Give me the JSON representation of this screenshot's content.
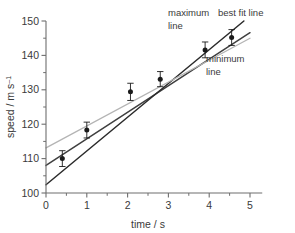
{
  "chart_data": {
    "type": "scatter",
    "title": "",
    "xlabel": "time / s",
    "ylabel": "speed / m s⁻¹",
    "ylabel_main": "speed / m s",
    "ylabel_exponent": "–1",
    "xlim": [
      0,
      5.3
    ],
    "ylim": [
      100,
      150
    ],
    "x_ticks_major": [
      0,
      1,
      2,
      3,
      4,
      5
    ],
    "x_tick_labels": [
      "0",
      "1",
      "2",
      "3",
      "4",
      "5"
    ],
    "x_ticks_minor": [
      0.5,
      1.5,
      2.5,
      3.5,
      4.5
    ],
    "y_ticks_major": [
      100,
      110,
      120,
      130,
      140,
      150
    ],
    "y_tick_labels": [
      "100",
      "110",
      "120",
      "130",
      "140",
      "150"
    ],
    "y_ticks_minor": [
      105,
      115,
      125,
      135,
      145
    ],
    "grid": false,
    "legend_position": "inline-annotations",
    "points": [
      {
        "x": 0.4,
        "y": 110.0,
        "yerr": 2.3
      },
      {
        "x": 1.0,
        "y": 118.3,
        "yerr": 2.3
      },
      {
        "x": 2.07,
        "y": 129.4,
        "yerr": 2.5
      },
      {
        "x": 2.8,
        "y": 133.1,
        "yerr": 2.2
      },
      {
        "x": 3.9,
        "y": 141.6,
        "yerr": 2.3
      },
      {
        "x": 4.55,
        "y": 145.2,
        "yerr": 2.3
      }
    ],
    "series": [
      {
        "name": "best fit line",
        "type": "line",
        "color": "#3f3f3f",
        "x": [
          0,
          5.0
        ],
        "y": [
          108.0,
          146.6
        ],
        "slope": 7.72,
        "intercept": 108.0
      },
      {
        "name": "maximum line",
        "type": "line",
        "color": "#2b2b2b",
        "x": [
          0,
          4.85
        ],
        "y": [
          102.4,
          150.0
        ],
        "slope": 9.81,
        "intercept": 102.4
      },
      {
        "name": "minimum line",
        "type": "line",
        "color": "#b4b4b4",
        "x": [
          0,
          5.0
        ],
        "y": [
          113.1,
          145.0
        ],
        "slope": 6.38,
        "intercept": 113.1
      }
    ],
    "annotations": [
      {
        "name": "maximum-line-label",
        "line1": "maximum",
        "line2": "line",
        "x": 190,
        "y": 16
      },
      {
        "name": "best-fit-line-label",
        "line1": "best fit line",
        "line2": "",
        "x": 236,
        "y": 16
      },
      {
        "name": "minimum-line-label",
        "line1": "minimum",
        "line2": "line",
        "x": 228,
        "y": 62
      }
    ]
  },
  "colors": {
    "axis": "#6e6e6e",
    "text": "#3a3a3a",
    "best_fit": "#3f3f3f",
    "maximum": "#2b2b2b",
    "minimum": "#b4b4b4",
    "marker": "#1a1a1a",
    "background": "#ffffff"
  }
}
